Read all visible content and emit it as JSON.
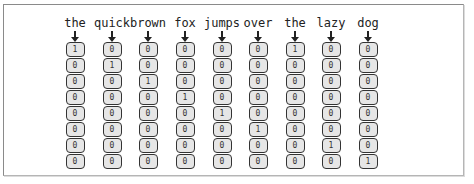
{
  "diagram": {
    "words": [
      "the",
      "quick",
      "brown",
      "fox",
      "jumps",
      "over",
      "the",
      "lazy",
      "dog"
    ],
    "vectors": [
      [
        "1",
        "0",
        "0",
        "0",
        "0",
        "0",
        "0",
        "0"
      ],
      [
        "0",
        "1",
        "0",
        "0",
        "0",
        "0",
        "0",
        "0"
      ],
      [
        "0",
        "0",
        "1",
        "0",
        "0",
        "0",
        "0",
        "0"
      ],
      [
        "0",
        "0",
        "0",
        "1",
        "0",
        "0",
        "0",
        "0"
      ],
      [
        "0",
        "0",
        "0",
        "0",
        "1",
        "0",
        "0",
        "0"
      ],
      [
        "0",
        "0",
        "0",
        "0",
        "0",
        "1",
        "0",
        "0"
      ],
      [
        "1",
        "0",
        "0",
        "0",
        "0",
        "0",
        "0",
        "0"
      ],
      [
        "0",
        "0",
        "0",
        "0",
        "0",
        "0",
        "1",
        "0"
      ],
      [
        "0",
        "0",
        "0",
        "0",
        "0",
        "0",
        "0",
        "1"
      ]
    ],
    "icons": {
      "arrow": "down-arrow-icon"
    },
    "colors": {
      "cell_fill": "#e6e6e6",
      "cell_border": "#333333",
      "frame_border": "#8a8a8a"
    }
  }
}
